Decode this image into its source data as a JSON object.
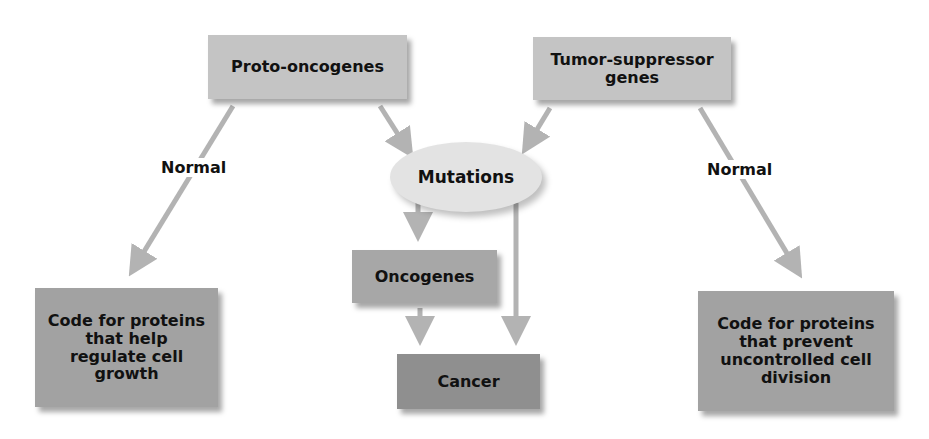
{
  "diagram": {
    "colors": {
      "top_box": "#c4c4c4",
      "ellipse": "#e3e3e3",
      "oncogenes_box": "#a7a7a7",
      "cancer_box": "#8f8f8f",
      "bottom_box": "#a2a2a2",
      "arrow": "#b3b3b3",
      "text": "#111111"
    },
    "nodes": {
      "proto_oncogenes": "Proto-oncogenes",
      "tumor_suppressor": "Tumor-suppressor genes",
      "mutations": "Mutations",
      "oncogenes": "Oncogenes",
      "cancer": "Cancer",
      "left_outcome": "Code for proteins that help regulate cell growth",
      "right_outcome": "Code for proteins that prevent uncontrolled cell division"
    },
    "edge_labels": {
      "left_normal": "Normal",
      "right_normal": "Normal"
    },
    "edges": [
      {
        "from": "proto_oncogenes",
        "to": "left_outcome",
        "label": "Normal"
      },
      {
        "from": "proto_oncogenes",
        "to": "mutations"
      },
      {
        "from": "tumor_suppressor",
        "to": "mutations"
      },
      {
        "from": "tumor_suppressor",
        "to": "right_outcome",
        "label": "Normal"
      },
      {
        "from": "mutations",
        "to": "oncogenes"
      },
      {
        "from": "mutations",
        "to": "cancer"
      },
      {
        "from": "oncogenes",
        "to": "cancer"
      }
    ]
  }
}
